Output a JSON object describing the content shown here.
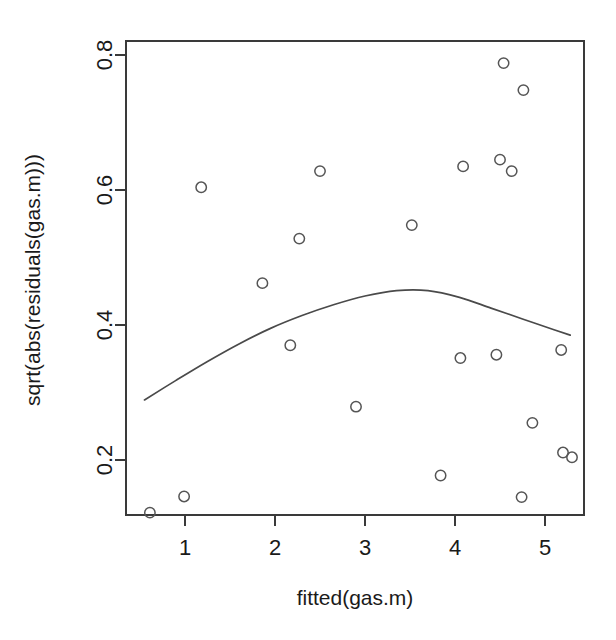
{
  "chart_data": {
    "type": "scatter",
    "title": "",
    "xlabel": "fitted(gas.m)",
    "ylabel": "sqrt(abs(residuals(gas.m)))",
    "xlim": [
      0.45,
      5.55
    ],
    "ylim": [
      0.095,
      0.825
    ],
    "xticks": [
      1,
      2,
      3,
      4,
      5
    ],
    "xticklabels": [
      "1",
      "2",
      "3",
      "4",
      "5"
    ],
    "yticks": [
      0.2,
      0.4,
      0.6,
      0.8
    ],
    "yticklabels": [
      "0.2",
      "0.4",
      "0.6",
      "0.8"
    ],
    "grid": false,
    "legend": null,
    "point_marker": "open-circle",
    "points": [
      {
        "x": 0.61,
        "y": 0.122
      },
      {
        "x": 0.99,
        "y": 0.146
      },
      {
        "x": 1.18,
        "y": 0.604
      },
      {
        "x": 1.86,
        "y": 0.462
      },
      {
        "x": 2.17,
        "y": 0.37
      },
      {
        "x": 2.27,
        "y": 0.528
      },
      {
        "x": 2.5,
        "y": 0.628
      },
      {
        "x": 2.9,
        "y": 0.279
      },
      {
        "x": 3.52,
        "y": 0.548
      },
      {
        "x": 3.84,
        "y": 0.177
      },
      {
        "x": 4.09,
        "y": 0.635
      },
      {
        "x": 4.06,
        "y": 0.351
      },
      {
        "x": 4.46,
        "y": 0.356
      },
      {
        "x": 4.5,
        "y": 0.645
      },
      {
        "x": 4.54,
        "y": 0.788
      },
      {
        "x": 4.63,
        "y": 0.628
      },
      {
        "x": 4.74,
        "y": 0.145
      },
      {
        "x": 4.76,
        "y": 0.748
      },
      {
        "x": 4.86,
        "y": 0.255
      },
      {
        "x": 5.18,
        "y": 0.363
      },
      {
        "x": 5.2,
        "y": 0.211
      },
      {
        "x": 5.3,
        "y": 0.204
      }
    ],
    "series": [
      {
        "name": "lowess-smoother",
        "type": "line",
        "x": [
          0.55,
          0.9,
          1.25,
          1.6,
          1.95,
          2.3,
          2.65,
          3.0,
          3.35,
          3.7,
          4.05,
          4.4,
          4.75,
          5.1,
          5.28
        ],
        "y": [
          0.289,
          0.318,
          0.346,
          0.372,
          0.395,
          0.414,
          0.43,
          0.443,
          0.451,
          0.451,
          0.441,
          0.425,
          0.409,
          0.393,
          0.385
        ]
      }
    ]
  },
  "style": {
    "axis_color": "#3a3a3a",
    "point_color": "#555555",
    "curve_color": "#4a4a4a",
    "background": "#ffffff"
  }
}
